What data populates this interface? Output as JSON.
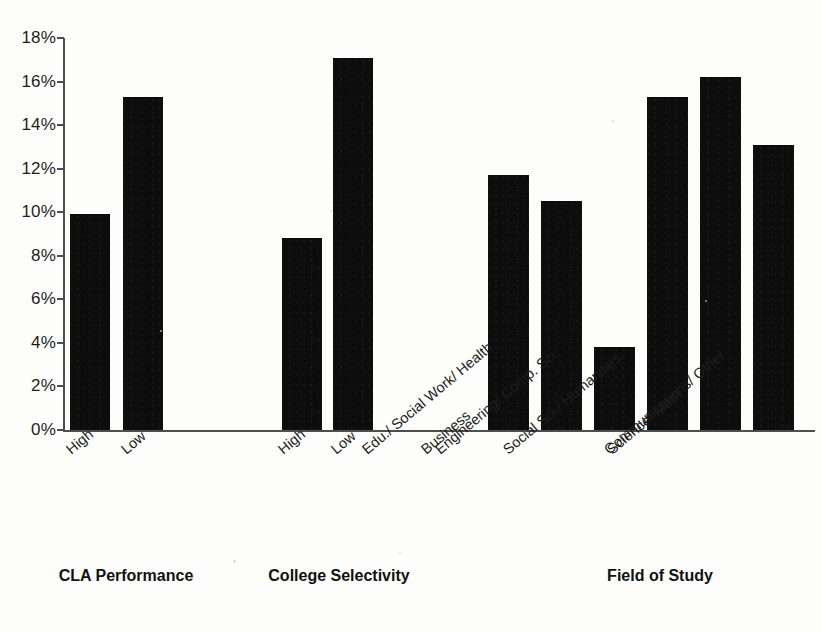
{
  "chart_data": {
    "type": "bar",
    "title": "",
    "subtitle": "",
    "xlabel": "",
    "ylabel": "",
    "ylim": [
      0,
      18
    ],
    "y_tick_labels": [
      "18%",
      "16%",
      "14%",
      "12%",
      "10%",
      "8%",
      "6%",
      "4%",
      "2%",
      "0%"
    ],
    "y_tick_values": [
      18,
      16,
      14,
      12,
      10,
      8,
      6,
      4,
      2,
      0
    ],
    "y_tick_step": 2,
    "grid": false,
    "legend": "none",
    "bar_color": "#0d0d0d",
    "axis_color": "#4e4e4e",
    "background_color": "#fdfdfb",
    "value_unit": "%",
    "groups": [
      {
        "name": "CLA Performance",
        "categories": [
          "High",
          "Low"
        ],
        "values": [
          9.9,
          15.3
        ]
      },
      {
        "name": "College Selectivity",
        "categories": [
          "High",
          "Low"
        ],
        "values": [
          8.8,
          17.1
        ]
      },
      {
        "name": "Field of Study",
        "categories": [
          "Business",
          "Edu./ Social Work/ Health",
          "Engineering/ Comp. Sci.",
          "Social Sci./ Humanities",
          "Science/ Math",
          "Communications/ Other"
        ],
        "values": [
          11.7,
          10.5,
          3.8,
          15.3,
          16.2,
          13.1
        ]
      }
    ],
    "categories": [
      "High",
      "Low",
      "High",
      "Low",
      "Business",
      "Edu./ Social Work/ Health",
      "Engineering/ Comp. Sci.",
      "Social Sci./ Humanities",
      "Science/ Math",
      "Communications/ Other"
    ],
    "values": [
      9.9,
      15.3,
      8.8,
      17.1,
      11.7,
      10.5,
      3.8,
      15.3,
      16.2,
      13.1
    ]
  },
  "layout": {
    "bars": [
      {
        "name": "bar-cla-high",
        "x": 70,
        "width": 40,
        "value": 9.9
      },
      {
        "name": "bar-cla-low",
        "x": 123,
        "width": 40,
        "value": 15.3
      },
      {
        "name": "bar-selectivity-high",
        "x": 282,
        "width": 40,
        "value": 8.8
      },
      {
        "name": "bar-selectivity-low",
        "x": 333,
        "width": 40,
        "value": 17.1
      },
      {
        "name": "bar-field-business",
        "x": 488,
        "width": 41,
        "value": 11.7
      },
      {
        "name": "bar-field-education",
        "x": 541,
        "width": 41,
        "value": 10.5
      },
      {
        "name": "bar-field-engineering",
        "x": 594,
        "width": 41,
        "value": 3.8
      },
      {
        "name": "bar-field-socialsci",
        "x": 647,
        "width": 41,
        "value": 15.3
      },
      {
        "name": "bar-field-sciencemath",
        "x": 700,
        "width": 41,
        "value": 16.2
      },
      {
        "name": "bar-field-communications",
        "x": 753,
        "width": 41,
        "value": 13.1
      }
    ],
    "category_label_anchors": [
      {
        "name": "cat-label-cla-high",
        "x": 63,
        "label": "High"
      },
      {
        "name": "cat-label-cla-low",
        "x": 118,
        "label": "Low"
      },
      {
        "name": "cat-label-selectivity-high",
        "x": 275,
        "label": "High"
      },
      {
        "name": "cat-label-selectivity-low",
        "x": 328,
        "label": "Low"
      },
      {
        "name": "cat-label-business",
        "x": 418,
        "label": "Business"
      },
      {
        "name": "cat-label-education",
        "x": 359,
        "label": "Edu./ Social Work/ Health"
      },
      {
        "name": "cat-label-engineering",
        "x": 432,
        "label": "Engineering/ Comp. Sci."
      },
      {
        "name": "cat-label-socialsci",
        "x": 500,
        "label": "Social Sci./ Humanities"
      },
      {
        "name": "cat-label-sciencemath",
        "x": 604,
        "label": "Science/ Math"
      },
      {
        "name": "cat-label-communications",
        "x": 601,
        "label": "Communications/ Other"
      }
    ],
    "group_title_anchors": [
      {
        "name": "group-title-cla-performance",
        "left": 16,
        "width": 220,
        "label": "CLA Performance"
      },
      {
        "name": "group-title-college-selectivity",
        "left": 224,
        "width": 230,
        "label": "College Selectivity"
      },
      {
        "name": "group-title-field-of-study",
        "left": 560,
        "width": 200,
        "label": "Field of Study"
      }
    ]
  }
}
